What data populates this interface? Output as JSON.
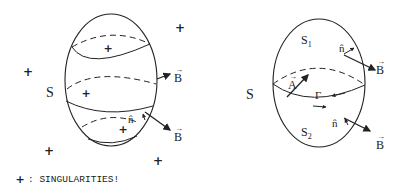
{
  "left_figure": {
    "surface_label": "S",
    "field_label_upper": "B",
    "field_label_lower": "B",
    "normal_label": "n̂",
    "singularity_marker": "+"
  },
  "right_figure": {
    "surface_label": "S",
    "upper_cap_label": "S",
    "upper_cap_subscript": "1",
    "lower_cap_label": "S",
    "lower_cap_subscript": "2",
    "normal_upper_label": "n̂",
    "normal_lower_label": "n̂",
    "field_label_upper": "B",
    "field_label_lower": "B",
    "vector_potential_label": "A",
    "curve_label": "Γ"
  },
  "legend": {
    "marker": "+",
    "text": ": SINGULARITIES!"
  }
}
